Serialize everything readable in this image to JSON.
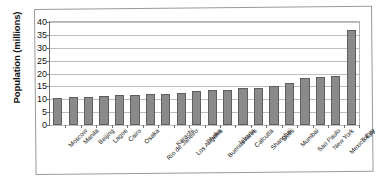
{
  "chart_data": {
    "type": "bar",
    "title": "",
    "xlabel": "",
    "ylabel": "Population (millions)",
    "ylim": [
      0,
      40
    ],
    "yticks": [
      0,
      5,
      10,
      15,
      20,
      25,
      30,
      35,
      40
    ],
    "grid": true,
    "legend": false,
    "orientation": "vertical",
    "bar_color": "#8a8a8a",
    "bar_edge_color": "#5e5e5e",
    "categories": [
      "Moscow",
      "Manila",
      "Beijing",
      "Lagos",
      "Cairo",
      "Osaka",
      "Rio de Janeiro",
      "Karachi",
      "Los Angeles",
      "Dhaka",
      "Buenos Aires",
      "Jakarta",
      "Calcutta",
      "Shanghai",
      "Delhi",
      "Mumbai",
      "Sao Paulo",
      "New York",
      "Mexico City",
      "Tokyo"
    ],
    "values": [
      10.5,
      10.7,
      10.8,
      11.1,
      11.5,
      11.8,
      12.0,
      12.2,
      12.3,
      13.2,
      13.5,
      13.6,
      14.3,
      14.5,
      15.3,
      16.4,
      18.3,
      18.5,
      19.0,
      37.0
    ]
  }
}
